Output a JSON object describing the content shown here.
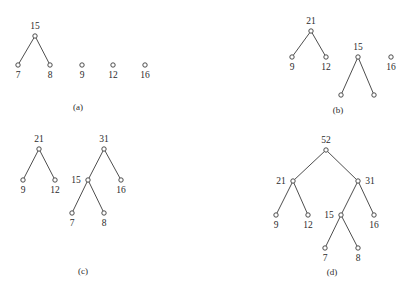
{
  "figure": {
    "background_color": "#ffffff",
    "stroke_color": "#3a3a3a",
    "text_color": "#2b2b2b",
    "node_radius": 2.2
  },
  "panels": [
    {
      "id": "a",
      "caption": "(a)",
      "caption_x": 78,
      "caption_y": 110,
      "nodes": [
        {
          "id": "a-15",
          "label": "15",
          "x": 35,
          "y": 36,
          "label_x": 35,
          "label_y": 29,
          "label_pos": "above"
        },
        {
          "id": "a-7",
          "label": "7",
          "x": 18,
          "y": 65,
          "label_x": 18,
          "label_y": 78,
          "label_pos": "below"
        },
        {
          "id": "a-8",
          "label": "8",
          "x": 50,
          "y": 65,
          "label_x": 50,
          "label_y": 78,
          "label_pos": "below"
        },
        {
          "id": "a-9",
          "label": "9",
          "x": 82,
          "y": 65,
          "label_x": 82,
          "label_y": 78,
          "label_pos": "below"
        },
        {
          "id": "a-12",
          "label": "12",
          "x": 113,
          "y": 65,
          "label_x": 113,
          "label_y": 78,
          "label_pos": "below"
        },
        {
          "id": "a-16",
          "label": "16",
          "x": 145,
          "y": 65,
          "label_x": 145,
          "label_y": 78,
          "label_pos": "below"
        }
      ],
      "edges": [
        {
          "from": "a-15",
          "to": "a-7"
        },
        {
          "from": "a-15",
          "to": "a-8"
        }
      ]
    },
    {
      "id": "b",
      "caption": "(b)",
      "caption_x": 338,
      "caption_y": 113,
      "nodes": [
        {
          "id": "b-21",
          "label": "21",
          "x": 311,
          "y": 31,
          "label_x": 311,
          "label_y": 24,
          "label_pos": "above"
        },
        {
          "id": "b-9",
          "label": "9",
          "x": 292,
          "y": 57,
          "label_x": 292,
          "label_y": 70,
          "label_pos": "below"
        },
        {
          "id": "b-12",
          "label": "12",
          "x": 326,
          "y": 57,
          "label_x": 326,
          "label_y": 70,
          "label_pos": "below"
        },
        {
          "id": "b-15",
          "label": "15",
          "x": 358,
          "y": 57,
          "label_x": 358,
          "label_y": 50,
          "label_pos": "above"
        },
        {
          "id": "b-16",
          "label": "16",
          "x": 391,
          "y": 57,
          "label_x": 391,
          "label_y": 70,
          "label_pos": "below"
        },
        {
          "id": "b-l1",
          "label": "",
          "x": 341,
          "y": 95,
          "label_x": 341,
          "label_y": 108,
          "label_pos": "below"
        },
        {
          "id": "b-l2",
          "label": "",
          "x": 374,
          "y": 95,
          "label_x": 374,
          "label_y": 108,
          "label_pos": "below"
        }
      ],
      "edges": [
        {
          "from": "b-21",
          "to": "b-9"
        },
        {
          "from": "b-21",
          "to": "b-12"
        },
        {
          "from": "b-15",
          "to": "b-l1"
        },
        {
          "from": "b-15",
          "to": "b-l2"
        }
      ]
    },
    {
      "id": "c",
      "caption": "(c)",
      "caption_x": 83,
      "caption_y": 274,
      "nodes": [
        {
          "id": "c-21",
          "label": "21",
          "x": 39,
          "y": 149,
          "label_x": 39,
          "label_y": 142,
          "label_pos": "above"
        },
        {
          "id": "c-31",
          "label": "31",
          "x": 104,
          "y": 149,
          "label_x": 104,
          "label_y": 142,
          "label_pos": "above"
        },
        {
          "id": "c-9",
          "label": "9",
          "x": 23,
          "y": 180,
          "label_x": 23,
          "label_y": 193,
          "label_pos": "below"
        },
        {
          "id": "c-12",
          "label": "12",
          "x": 55,
          "y": 180,
          "label_x": 55,
          "label_y": 193,
          "label_pos": "below"
        },
        {
          "id": "c-15",
          "label": "15",
          "x": 88,
          "y": 180,
          "label_x": 76,
          "label_y": 183,
          "label_pos": "left"
        },
        {
          "id": "c-16",
          "label": "16",
          "x": 121,
          "y": 180,
          "label_x": 121,
          "label_y": 193,
          "label_pos": "below"
        },
        {
          "id": "c-7",
          "label": "7",
          "x": 72,
          "y": 213,
          "label_x": 72,
          "label_y": 226,
          "label_pos": "below"
        },
        {
          "id": "c-8",
          "label": "8",
          "x": 104,
          "y": 213,
          "label_x": 104,
          "label_y": 226,
          "label_pos": "below"
        }
      ],
      "edges": [
        {
          "from": "c-21",
          "to": "c-9"
        },
        {
          "from": "c-21",
          "to": "c-12"
        },
        {
          "from": "c-31",
          "to": "c-15"
        },
        {
          "from": "c-31",
          "to": "c-16"
        },
        {
          "from": "c-15",
          "to": "c-7"
        },
        {
          "from": "c-15",
          "to": "c-8"
        }
      ]
    },
    {
      "id": "d",
      "caption": "(d)",
      "caption_x": 332,
      "caption_y": 275,
      "nodes": [
        {
          "id": "d-52",
          "label": "52",
          "x": 326,
          "y": 150,
          "label_x": 326,
          "label_y": 143,
          "label_pos": "above"
        },
        {
          "id": "d-21",
          "label": "21",
          "x": 293,
          "y": 181,
          "label_x": 281,
          "label_y": 184,
          "label_pos": "left"
        },
        {
          "id": "d-31",
          "label": "31",
          "x": 358,
          "y": 181,
          "label_x": 370,
          "label_y": 184,
          "label_pos": "right"
        },
        {
          "id": "d-9",
          "label": "9",
          "x": 276,
          "y": 215,
          "label_x": 276,
          "label_y": 228,
          "label_pos": "below"
        },
        {
          "id": "d-12",
          "label": "12",
          "x": 308,
          "y": 215,
          "label_x": 308,
          "label_y": 228,
          "label_pos": "below"
        },
        {
          "id": "d-15",
          "label": "15",
          "x": 341,
          "y": 215,
          "label_x": 329,
          "label_y": 218,
          "label_pos": "left"
        },
        {
          "id": "d-16",
          "label": "16",
          "x": 374,
          "y": 215,
          "label_x": 374,
          "label_y": 228,
          "label_pos": "below"
        },
        {
          "id": "d-7",
          "label": "7",
          "x": 325,
          "y": 248,
          "label_x": 325,
          "label_y": 261,
          "label_pos": "below"
        },
        {
          "id": "d-8",
          "label": "8",
          "x": 358,
          "y": 248,
          "label_x": 358,
          "label_y": 261,
          "label_pos": "below"
        }
      ],
      "edges": [
        {
          "from": "d-52",
          "to": "d-21"
        },
        {
          "from": "d-52",
          "to": "d-31"
        },
        {
          "from": "d-21",
          "to": "d-9"
        },
        {
          "from": "d-21",
          "to": "d-12"
        },
        {
          "from": "d-31",
          "to": "d-15"
        },
        {
          "from": "d-31",
          "to": "d-16"
        },
        {
          "from": "d-15",
          "to": "d-7"
        },
        {
          "from": "d-15",
          "to": "d-8"
        }
      ]
    }
  ]
}
